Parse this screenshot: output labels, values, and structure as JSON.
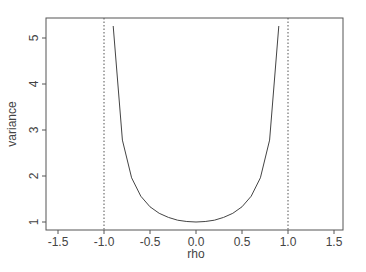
{
  "chart_data": {
    "type": "line",
    "title": "",
    "xlabel": "rho",
    "ylabel": "variance",
    "xlim": [
      -1.65,
      1.6
    ],
    "ylim": [
      0.85,
      5.45
    ],
    "xticks": [
      -1.5,
      -1.0,
      -0.5,
      0.0,
      0.5,
      1.0,
      1.5
    ],
    "xtick_labels": [
      "-1.5",
      "-1.0",
      "-0.5",
      "0.0",
      "0.5",
      "1.0",
      "1.5"
    ],
    "yticks": [
      1,
      2,
      3,
      4,
      5
    ],
    "ytick_labels": [
      "1",
      "2",
      "3",
      "4",
      "5"
    ],
    "grid": false,
    "legend": null,
    "series": [
      {
        "name": "variance = 1/(1-rho^2)",
        "x": [
          -0.9,
          -0.8,
          -0.7,
          -0.6,
          -0.5,
          -0.4,
          -0.3,
          -0.2,
          -0.1,
          0.0,
          0.1,
          0.2,
          0.3,
          0.4,
          0.5,
          0.6,
          0.7,
          0.8,
          0.9
        ],
        "y": [
          5.26,
          2.78,
          1.96,
          1.56,
          1.33,
          1.19,
          1.1,
          1.04,
          1.01,
          1.0,
          1.01,
          1.04,
          1.1,
          1.19,
          1.33,
          1.56,
          1.96,
          2.78,
          5.26
        ]
      }
    ],
    "vlines": [
      {
        "x": -1.0,
        "style": "dotted"
      },
      {
        "x": 1.0,
        "style": "dotted"
      }
    ]
  },
  "colors": {
    "axis": "#555555",
    "line": "#444444",
    "text": "#444444"
  }
}
